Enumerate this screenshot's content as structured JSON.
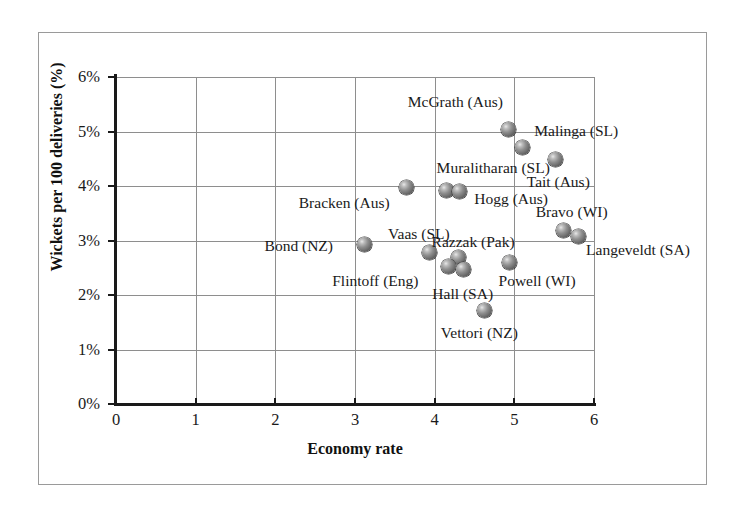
{
  "chart_data": {
    "type": "scatter",
    "title": "",
    "xlabel": "Economy rate",
    "ylabel": "Wickets per 100 deliveries (%)",
    "xlim": [
      0,
      6
    ],
    "ylim": [
      0,
      6
    ],
    "x_ticks": [
      "0",
      "1",
      "2",
      "3",
      "4",
      "5",
      "6"
    ],
    "y_ticks": [
      "0%",
      "1%",
      "2%",
      "3%",
      "4%",
      "5%",
      "6%"
    ],
    "x_tick_values": [
      0,
      1,
      2,
      3,
      4,
      5,
      6
    ],
    "y_tick_values": [
      0,
      1,
      2,
      3,
      4,
      5,
      6
    ],
    "grid": "both",
    "legend": "none",
    "marker_style": "shaded-grey-sphere",
    "points": [
      {
        "label": "McGrath (Aus)",
        "x": 4.93,
        "y": 5.03,
        "label_dx": -101,
        "label_dy": -28
      },
      {
        "label": "Malinga (SL)",
        "x": 5.1,
        "y": 4.7,
        "label_dx": 12,
        "label_dy": -17
      },
      {
        "label": "Tait (Aus)",
        "x": 5.52,
        "y": 4.48,
        "label_dx": -29,
        "label_dy": 22
      },
      {
        "label": "Muralitharan (SL)",
        "x": 4.15,
        "y": 3.92,
        "label_dx": -10,
        "label_dy": -22
      },
      {
        "label": "Hogg (Aus)",
        "x": 4.31,
        "y": 3.9,
        "label_dx": 15,
        "label_dy": 8
      },
      {
        "label": "Bracken (Aus)",
        "x": 3.65,
        "y": 3.98,
        "label_dx": -108,
        "label_dy": 16
      },
      {
        "label": "Bravo (WI)",
        "x": 5.62,
        "y": 3.18,
        "label_dx": -28,
        "label_dy": -19
      },
      {
        "label": "Langeveldt (SA)",
        "x": 5.8,
        "y": 3.08,
        "label_dx": 8,
        "label_dy": 14
      },
      {
        "label": "Bond (NZ)",
        "x": 3.12,
        "y": 2.93,
        "label_dx": -100,
        "label_dy": 2
      },
      {
        "label": "Vaas (SL)",
        "x": 3.93,
        "y": 2.78,
        "label_dx": -41,
        "label_dy": -18
      },
      {
        "label": "Razzak (Pak)",
        "x": 4.3,
        "y": 2.68,
        "label_dx": -27,
        "label_dy": -16
      },
      {
        "label": "Powell (WI)",
        "x": 4.94,
        "y": 2.6,
        "label_dx": -11,
        "label_dy": 19
      },
      {
        "label": "Flintoff (Eng)",
        "x": 4.17,
        "y": 2.52,
        "label_dx": -116,
        "label_dy": 14
      },
      {
        "label": "Hall (SA)",
        "x": 4.36,
        "y": 2.47,
        "label_dx": -31,
        "label_dy": 25
      },
      {
        "label": "Vettori (NZ)",
        "x": 4.63,
        "y": 1.71,
        "label_dx": -44,
        "label_dy": 22
      }
    ]
  }
}
